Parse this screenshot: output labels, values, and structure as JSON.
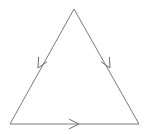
{
  "figure": {
    "background_color": "#ffffff",
    "width": 150,
    "height": 134
  },
  "style": {
    "stroke_color": "#7a7a7a",
    "stroke_width": 1,
    "arrow_stroke_color": "#6e6e6e",
    "arrow_stroke_width": 1
  },
  "chart_data": {
    "type": "diagram",
    "shape": "triangle",
    "vertices": [
      {
        "name": "apex",
        "label": "A",
        "x": 74,
        "y": 9
      },
      {
        "name": "bottom-left",
        "label": "B",
        "x": 10,
        "y": 124
      },
      {
        "name": "bottom-right",
        "label": "C",
        "x": 139,
        "y": 124
      }
    ],
    "edges": [
      {
        "name": "left-edge",
        "from": "apex",
        "to": "bottom-left",
        "path": "M 74 9 L 10 124",
        "direction": "down-left",
        "arrow": {
          "name": "left-edge-arrow",
          "tip_x": 38,
          "tip_y": 68,
          "angle_deg": 119,
          "barb_length": 11,
          "barb_spread_deg": 26
        }
      },
      {
        "name": "right-edge",
        "from": "apex",
        "to": "bottom-right",
        "path": "M 74 9 L 139 124",
        "direction": "down-right",
        "arrow": {
          "name": "right-edge-arrow",
          "tip_x": 110,
          "tip_y": 68,
          "angle_deg": 61,
          "barb_length": 11,
          "barb_spread_deg": 26
        }
      },
      {
        "name": "bottom-edge",
        "from": "bottom-left",
        "to": "bottom-right",
        "path": "M 10 124 L 139 124",
        "direction": "right",
        "arrow": {
          "name": "bottom-edge-arrow",
          "tip_x": 79,
          "tip_y": 124,
          "angle_deg": 0,
          "barb_length": 11,
          "barb_spread_deg": 26
        }
      }
    ],
    "legend": [],
    "annotations": [],
    "grid": false
  }
}
